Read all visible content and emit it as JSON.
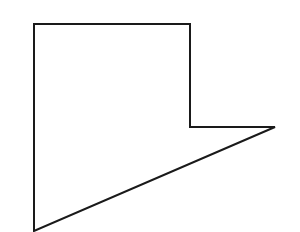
{
  "figure": {
    "background_color": "#ffffff",
    "stroke_color": "#1a1a1a",
    "fill_color": "none",
    "stroke_width": 2,
    "canvas": {
      "width": 300,
      "height": 232
    },
    "vertices": [
      {
        "name": "top-left",
        "x": 34,
        "y": 24
      },
      {
        "name": "top-right",
        "x": 190,
        "y": 24
      },
      {
        "name": "inner-corner",
        "x": 190,
        "y": 127
      },
      {
        "name": "right-tip",
        "x": 275,
        "y": 127
      },
      {
        "name": "bottom-left",
        "x": 34,
        "y": 231
      }
    ],
    "path": "M 34 24 L 190 24 L 190 127 L 275 127 L 34 231 Z",
    "edges": [
      {
        "name": "top-edge",
        "from": "top-left",
        "to": "top-right",
        "orientation": "horizontal"
      },
      {
        "name": "right-upper-edge",
        "from": "top-right",
        "to": "inner-corner",
        "orientation": "vertical"
      },
      {
        "name": "notch-edge",
        "from": "inner-corner",
        "to": "right-tip",
        "orientation": "horizontal"
      },
      {
        "name": "diagonal-edge",
        "from": "right-tip",
        "to": "bottom-left",
        "orientation": "diagonal"
      },
      {
        "name": "left-edge",
        "from": "bottom-left",
        "to": "top-left",
        "orientation": "vertical"
      }
    ],
    "artifacts": {
      "type": "scan-smudges",
      "color": "#fafafa",
      "count": 5
    }
  }
}
